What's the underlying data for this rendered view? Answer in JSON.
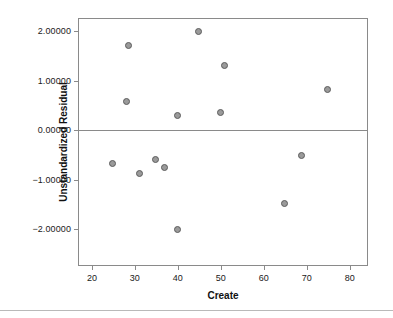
{
  "chart_data": {
    "type": "scatter",
    "title": "",
    "xlabel": "Create",
    "ylabel": "Unstandardized Residual",
    "xlim": [
      17,
      84
    ],
    "ylim": [
      -2.72,
      2.24
    ],
    "xticks": [
      20,
      30,
      40,
      50,
      60,
      70,
      80
    ],
    "xticklabels": [
      "20",
      "30",
      "40",
      "50",
      "60",
      "70",
      "80"
    ],
    "yticks": [
      2,
      1,
      0,
      -1,
      -2
    ],
    "yticklabels": [
      "2.00000",
      "1.00000",
      "0.00000",
      "-1.00000",
      "-2.00000"
    ],
    "grid": false,
    "legend": false,
    "reference_line": {
      "axis": "y",
      "value": 0,
      "color": "#8a8a8a"
    },
    "marker": {
      "shape": "circle",
      "fill_color": "#9a9a9a",
      "edge_color": "#5d5d5d",
      "size_px": 7
    },
    "frame_color": "#8a8a8a",
    "background": "#ffffff",
    "points": [
      {
        "x": 28.5,
        "y": 1.7
      },
      {
        "x": 28.0,
        "y": 0.58
      },
      {
        "x": 44.8,
        "y": 1.99
      },
      {
        "x": 50.8,
        "y": 1.3
      },
      {
        "x": 74.8,
        "y": 0.81
      },
      {
        "x": 50.0,
        "y": 0.36
      },
      {
        "x": 39.8,
        "y": 0.29
      },
      {
        "x": 24.8,
        "y": -0.67
      },
      {
        "x": 31.0,
        "y": -0.88
      },
      {
        "x": 34.8,
        "y": -0.6
      },
      {
        "x": 37.0,
        "y": -0.76
      },
      {
        "x": 39.8,
        "y": -2.0
      },
      {
        "x": 64.8,
        "y": -1.48
      },
      {
        "x": 68.8,
        "y": -0.51
      }
    ]
  }
}
